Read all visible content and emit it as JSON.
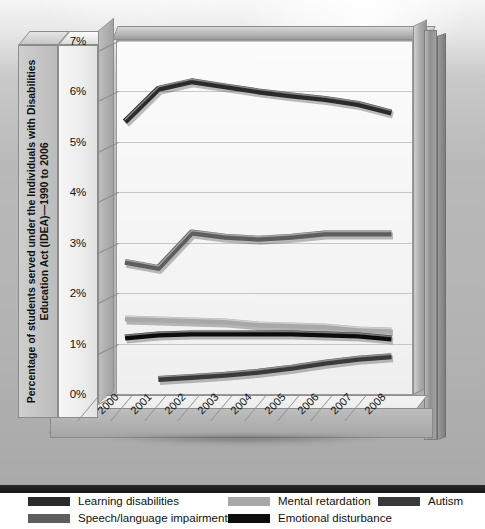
{
  "chart_data": {
    "type": "line",
    "title": "",
    "xlabel": "",
    "ylabel": "Percentage of students served under the Individuals with Disabilities Education Act (IDEA)—1990 to 2006",
    "categories": [
      "2000",
      "2001",
      "2002",
      "2003",
      "2004",
      "2005",
      "2006",
      "2007",
      "2008"
    ],
    "ylim": [
      0,
      7
    ],
    "y_ticks": [
      "0%",
      "1%",
      "2%",
      "3%",
      "4%",
      "5%",
      "6%",
      "7%"
    ],
    "y_tick_values": [
      0,
      1,
      2,
      3,
      4,
      5,
      6,
      7
    ],
    "grid": true,
    "legend_position": "bottom",
    "series": [
      {
        "name": "Learning disabilities",
        "color": "#2b2b2b",
        "values": [
          5.4,
          6.05,
          6.2,
          6.1,
          6.0,
          5.92,
          5.85,
          5.75,
          5.58
        ]
      },
      {
        "name": "Speech/language impairments",
        "color": "#5e5e5e",
        "values": [
          2.62,
          2.5,
          3.2,
          3.12,
          3.08,
          3.12,
          3.18,
          3.18,
          3.18
        ]
      },
      {
        "name": "Mental retardation",
        "color": "#a8a8a8",
        "values": [
          1.5,
          1.48,
          1.46,
          1.44,
          1.38,
          1.36,
          1.34,
          1.28,
          1.26
        ]
      },
      {
        "name": "Emotional disturbance",
        "color": "#0d0d0d",
        "values": [
          1.12,
          1.18,
          1.2,
          1.2,
          1.2,
          1.2,
          1.18,
          1.16,
          1.1
        ]
      },
      {
        "name": "Autism",
        "color": "#3a3a3a",
        "values": [
          null,
          0.3,
          0.34,
          0.38,
          0.44,
          0.52,
          0.62,
          0.7,
          0.75
        ]
      }
    ]
  },
  "legend": {
    "items": [
      {
        "label": "Learning disabilities",
        "color": "#2b2b2b"
      },
      {
        "label": "Speech/language impairments",
        "color": "#5e5e5e"
      },
      {
        "label": "Mental retardation",
        "color": "#a8a8a8"
      },
      {
        "label": "Emotional disturbance",
        "color": "#0d0d0d"
      },
      {
        "label": "Autism",
        "color": "#3a3a3a"
      }
    ]
  },
  "axis": {
    "y_title": "Percentage of students served under the Individuals with Disabilities Education Act (IDEA)—1990 to 2006"
  }
}
